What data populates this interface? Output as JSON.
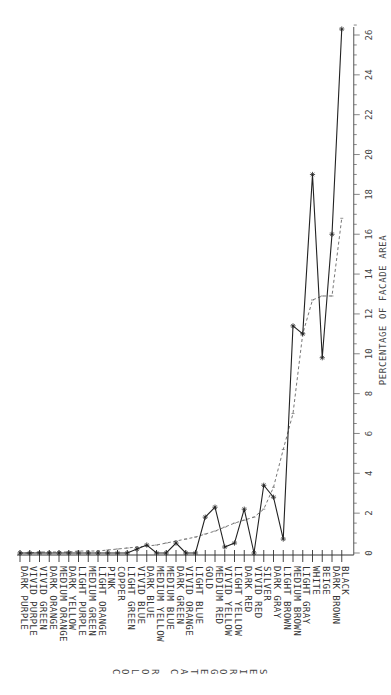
{
  "chart_data": {
    "type": "line",
    "title": "",
    "xlabel": "COLOR CATEGORIES",
    "ylabel": "PERCENTAGE OF FACADE AREA",
    "orientation": "rotated 90deg (value axis on right, categories along bottom, text read vertically)",
    "ylim": [
      0,
      26
    ],
    "y_ticks": [
      0,
      2,
      4,
      6,
      8,
      10,
      12,
      14,
      16,
      18,
      20,
      22,
      24,
      26
    ],
    "grid": false,
    "categories": [
      "DARK PURPLE",
      "VIVID PURPLE",
      "VIVID GREEN",
      "DARK ORANGE",
      "MEDIUM ORANGE",
      "DARK YELLOW",
      "LIGHT PURPLE",
      "MEDIUM GREEN",
      "LIGHT ORANGE",
      "PINK",
      "COPPER",
      "LIGHT GREEN",
      "VIVID BLUE",
      "DARK BLUE",
      "MEDIUM YELLOW",
      "MEDIUM BLUE",
      "DARK GREEN",
      "VIVID ORANGE",
      "LIGHT BLUE",
      "GOLD",
      "MEDIUM RED",
      "VIVID YELLOW",
      "LIGHT YELLOW",
      "DARK RED",
      "VIVID RED",
      "SILVER",
      "DARK GRAY",
      "LIGHT BROWN",
      "MEDIUM BROWN",
      "LIGHT GRAY",
      "WHITE",
      "BEIGE",
      "DARK BROWN",
      "BLACK"
    ],
    "series": [
      {
        "name": "observed",
        "style": "solid line with star markers",
        "values": [
          0,
          0,
          0,
          0,
          0,
          0,
          0,
          0,
          0,
          0,
          0,
          0,
          0.2,
          0.4,
          0,
          0,
          0.5,
          0,
          0,
          1.8,
          2.3,
          0.3,
          0.5,
          2.2,
          0,
          3.4,
          2.8,
          0.7,
          11.4,
          11.0,
          19.0,
          9.8,
          16.0,
          26.3
        ]
      },
      {
        "name": "trend",
        "style": "dashed line with small markers",
        "values": [
          0,
          0,
          0.05,
          0.05,
          0.05,
          0.05,
          0.1,
          0.1,
          0.1,
          0.15,
          0.2,
          0.25,
          0.3,
          0.35,
          0.4,
          0.5,
          0.6,
          0.7,
          0.8,
          0.95,
          1.1,
          1.3,
          1.5,
          1.65,
          1.8,
          2.2,
          3.3,
          5.2,
          7.0,
          11.0,
          12.7,
          12.9,
          12.9,
          16.8
        ]
      }
    ]
  },
  "labels": {
    "xlabel_letters": [
      "C",
      "O",
      "L",
      "O",
      "R",
      " ",
      "C",
      "A",
      "T",
      "E",
      "G",
      "O",
      "R",
      "I",
      "E",
      "S"
    ]
  }
}
